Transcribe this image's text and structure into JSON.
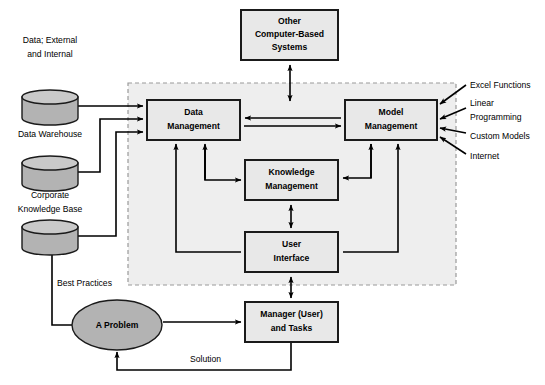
{
  "diagram": {
    "colors": {
      "box_fill": "#e8e8e8",
      "box_stroke": "#1a1a1a",
      "cylinder_fill": "#b3b3b3",
      "cylinder_stroke": "#1a1a1a",
      "ellipse_fill": "#b3b3b3",
      "dashed_region_fill": "#eeeeee",
      "dashed_region_stroke": "#999999",
      "arrow": "#000000",
      "text": "#000000"
    },
    "boxes": [
      {
        "id": "other-systems",
        "line1": "Other",
        "line2": "Computer-Based",
        "line3": "Systems",
        "x": 241,
        "y": 10,
        "w": 97,
        "h": 50
      },
      {
        "id": "data-management",
        "line1": "Data",
        "line2": "Management",
        "line3": "",
        "x": 147,
        "y": 100,
        "w": 93,
        "h": 40
      },
      {
        "id": "model-management",
        "line1": "Model",
        "line2": "Management",
        "line3": "",
        "x": 345,
        "y": 100,
        "w": 92,
        "h": 40
      },
      {
        "id": "knowledge-management",
        "line1": "Knowledge",
        "line2": "Management",
        "line3": "",
        "x": 245,
        "y": 160,
        "w": 93,
        "h": 40
      },
      {
        "id": "user-interface",
        "line1": "User",
        "line2": "Interface",
        "line3": "",
        "x": 245,
        "y": 232,
        "w": 93,
        "h": 40
      },
      {
        "id": "manager-tasks",
        "line1": "Manager (User)",
        "line2": "and Tasks",
        "line3": "",
        "x": 245,
        "y": 302,
        "w": 93,
        "h": 40
      }
    ],
    "cylinders": [
      {
        "id": "data-warehouse",
        "caption_above_line1": "Data; External",
        "caption_above_line2": "and Internal",
        "caption_below_line1": "Data Warehouse",
        "caption_below_line2": "",
        "cx": 50,
        "top": 90,
        "rx": 28,
        "ry": 7,
        "body_h": 28
      },
      {
        "id": "corporate-knowledge-base",
        "caption_above_line1": "",
        "caption_above_line2": "",
        "caption_below_line1": "Corporate",
        "caption_below_line2": "Knowledge Base",
        "cx": 50,
        "top": 150,
        "rx": 28,
        "ry": 7,
        "body_h": 28
      },
      {
        "id": "best-practices-store",
        "caption_above_line1": "",
        "caption_above_line2": "",
        "caption_below_line1": "",
        "caption_below_line2": "",
        "cx": 50,
        "top": 215,
        "rx": 28,
        "ry": 7,
        "body_h": 28
      }
    ],
    "ellipse": {
      "id": "a-problem",
      "label": "A Problem",
      "cx": 117,
      "cy": 325,
      "rx": 45,
      "ry": 25
    },
    "external_inputs": {
      "items": [
        {
          "label": "Excel Functions",
          "x": 470,
          "y": 86
        },
        {
          "label_line1": "Linear",
          "label_line2": "Programming",
          "x": 470,
          "y": 104
        },
        {
          "label": "Custom Models",
          "x": 470,
          "y": 137
        },
        {
          "label": "Internet",
          "x": 470,
          "y": 157
        }
      ]
    },
    "flow_labels": [
      {
        "id": "best-practices",
        "text": "Best Practices",
        "x": 55,
        "y": 284
      },
      {
        "id": "solution",
        "text": "Solution",
        "x": 212,
        "y": 360
      }
    ],
    "dashed_region": {
      "id": "dss-boundary",
      "x": 128,
      "y": 83,
      "w": 328,
      "h": 202
    }
  }
}
